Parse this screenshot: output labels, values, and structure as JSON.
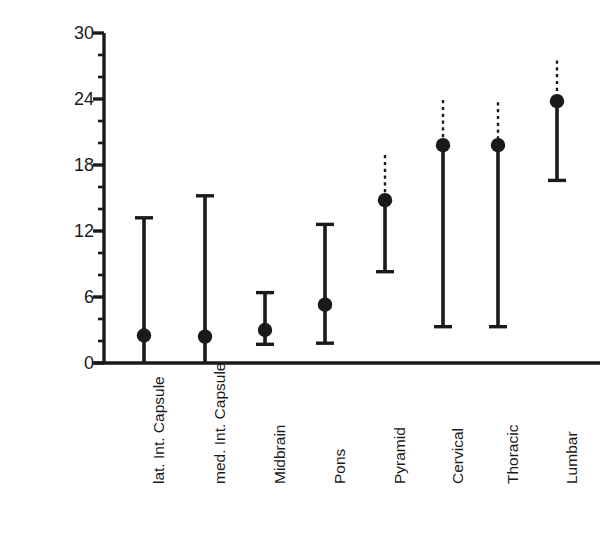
{
  "chart_data": {
    "type": "scatter",
    "title": "",
    "xlabel": "",
    "ylabel": "Postnatal Months",
    "ylim": [
      0,
      30
    ],
    "ytick_values": [
      0,
      6,
      12,
      18,
      24,
      30
    ],
    "ytick_labels": [
      "0",
      "6",
      "12",
      "18",
      "24",
      "30"
    ],
    "y_minor_tick_interval": 2,
    "grid": false,
    "legend": "none",
    "marker": "filled-circle",
    "error_bar_style": "vertical range with horizontal caps; dashed segment above marker where upper bound is uncertain",
    "categories": [
      "lat. Int. Capsule",
      "med. Int. Capsule",
      "Midbrain",
      "Pons",
      "Pyramid",
      "Cervical",
      "Thoracic",
      "Lumbar"
    ],
    "values": [
      2.5,
      2.4,
      3.0,
      5.3,
      14.8,
      19.8,
      19.8,
      23.8
    ],
    "lower_bounds": [
      0.0,
      0.0,
      1.7,
      1.8,
      8.3,
      3.3,
      3.3,
      16.6
    ],
    "upper_bounds": [
      13.2,
      15.2,
      6.4,
      12.6,
      18.9,
      23.9,
      23.7,
      27.5
    ],
    "upper_dashed": [
      false,
      false,
      false,
      false,
      true,
      true,
      true,
      true
    ],
    "lower_capped": [
      false,
      false,
      true,
      true,
      true,
      true,
      true,
      true
    ],
    "points": [
      {
        "category": "lat. Int. Capsule",
        "value": 2.5,
        "low": 0.0,
        "high": 13.2,
        "high_dashed": false
      },
      {
        "category": "med. Int. Capsule",
        "value": 2.4,
        "low": 0.0,
        "high": 15.2,
        "high_dashed": false
      },
      {
        "category": "Midbrain",
        "value": 3.0,
        "low": 1.7,
        "high": 6.4,
        "high_dashed": false
      },
      {
        "category": "Pons",
        "value": 5.3,
        "low": 1.8,
        "high": 12.6,
        "high_dashed": false
      },
      {
        "category": "Pyramid",
        "value": 14.8,
        "low": 8.3,
        "high": 18.9,
        "high_dashed": true
      },
      {
        "category": "Cervical",
        "value": 19.8,
        "low": 3.3,
        "high": 23.9,
        "high_dashed": true
      },
      {
        "category": "Thoracic",
        "value": 19.8,
        "low": 3.3,
        "high": 23.7,
        "high_dashed": true
      },
      {
        "category": "Lumbar",
        "value": 23.8,
        "low": 16.6,
        "high": 27.5,
        "high_dashed": true
      }
    ],
    "colors": {
      "ink": "#1a1a1a",
      "background": "#ffffff"
    }
  }
}
